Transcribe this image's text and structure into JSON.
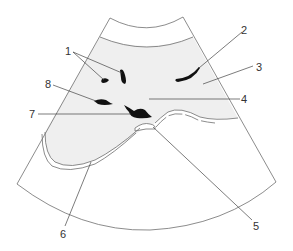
{
  "diagram": {
    "type": "ultrasound-sector-schematic",
    "colors": {
      "outline": "#6e6e6e",
      "shaded_region": "#efefef",
      "echo_dark": "#111111",
      "label_text": "#333333",
      "leader_line": "#444444"
    },
    "labels": [
      {
        "id": "1",
        "text": "1",
        "x": 65,
        "y": 46
      },
      {
        "id": "2",
        "text": "2",
        "x": 241,
        "y": 25
      },
      {
        "id": "3",
        "text": "3",
        "x": 256,
        "y": 62
      },
      {
        "id": "4",
        "text": "4",
        "x": 241,
        "y": 96
      },
      {
        "id": "5",
        "text": "5",
        "x": 256,
        "y": 221
      },
      {
        "id": "6",
        "text": "6",
        "x": 60,
        "y": 229
      },
      {
        "id": "7",
        "text": "7",
        "x": 29,
        "y": 109
      },
      {
        "id": "8",
        "text": "8",
        "x": 45,
        "y": 80
      }
    ]
  }
}
